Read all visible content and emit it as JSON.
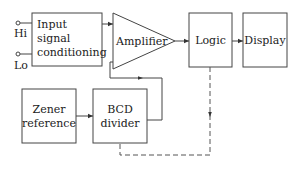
{
  "diagram": {
    "type": "block-diagram",
    "inputs": {
      "hi_label": "Hi",
      "lo_label": "Lo"
    },
    "blocks": {
      "input_conditioning": {
        "line1": "Input",
        "line2": "signal",
        "line3": "conditioning"
      },
      "amplifier": {
        "label": "Amplifier"
      },
      "logic": {
        "label": "Logic"
      },
      "display": {
        "label": "Display"
      },
      "zener": {
        "line1": "Zener",
        "line2": "reference"
      },
      "bcd": {
        "line1": "BCD",
        "line2": "divider"
      }
    },
    "connections": [
      {
        "from": "Input signal conditioning",
        "to": "Amplifier",
        "style": "solid"
      },
      {
        "from": "Amplifier",
        "to": "Logic",
        "style": "solid"
      },
      {
        "from": "Logic",
        "to": "Display",
        "style": "solid"
      },
      {
        "from": "Zener reference",
        "to": "BCD divider",
        "style": "solid"
      },
      {
        "from": "BCD divider",
        "to": "Amplifier",
        "style": "solid"
      },
      {
        "from": "Logic",
        "to": "BCD divider",
        "style": "dashed"
      }
    ],
    "colors": {
      "line": "#444444",
      "text": "#222222",
      "background": "#ffffff"
    }
  }
}
